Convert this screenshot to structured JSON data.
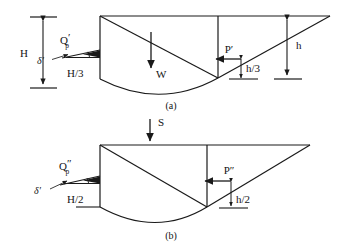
{
  "figure": {
    "panels": [
      {
        "id": "a",
        "caption": "(a)",
        "labels": {
          "wall_height": "H",
          "resultant_force": "Q",
          "resultant_force_sub": "p",
          "resultant_force_prime": "′",
          "wall_arm": "H/3",
          "friction_angle": "δ′",
          "weight": "W",
          "pressure_force": "P′",
          "pressure_arm": "h/3",
          "soil_depth": "h"
        }
      },
      {
        "id": "b",
        "caption": "(b)",
        "labels": {
          "surcharge": "S",
          "resultant_force": "Q",
          "resultant_force_sub": "p",
          "resultant_force_prime": "″",
          "wall_arm": "H/2",
          "friction_angle": "δ′",
          "pressure_force": "P″",
          "pressure_arm": "h/2"
        }
      }
    ],
    "colors": {
      "line": "#1a1a1a",
      "background": "#ffffff",
      "text": "#141414"
    }
  }
}
